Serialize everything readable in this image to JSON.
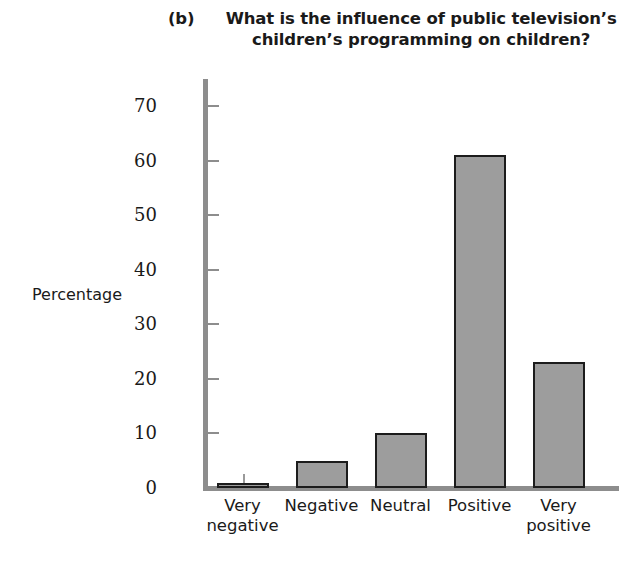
{
  "title": {
    "panel_letter": "(b)",
    "text": "What is the influence of public television’s children’s programming on children?"
  },
  "axes": {
    "ylabel": "Percentage",
    "xlabel": "",
    "y_ticks": [
      "0",
      "10",
      "20",
      "30",
      "40",
      "50",
      "60",
      "70"
    ]
  },
  "categories": [
    {
      "line1": "Very",
      "line2": "negative"
    },
    {
      "line1": "Negative",
      "line2": ""
    },
    {
      "line1": "Neutral",
      "line2": ""
    },
    {
      "line1": "Positive",
      "line2": ""
    },
    {
      "line1": "Very",
      "line2": "positive"
    }
  ],
  "colors": {
    "bar_fill": "#9d9d9d",
    "bar_stroke": "#1c1c1c",
    "axis": "#8d8d8d",
    "text": "#1a1a1a",
    "background": "#ffffff"
  },
  "chart_data": {
    "type": "bar",
    "title": "(b) What is the influence of public television’s children’s programming on children?",
    "xlabel": "",
    "ylabel": "Percentage",
    "categories": [
      "Very negative",
      "Negative",
      "Neutral",
      "Positive",
      "Very positive"
    ],
    "values": [
      1,
      5,
      10,
      61,
      23
    ],
    "ylim": [
      0,
      75
    ],
    "yticks": [
      0,
      10,
      20,
      30,
      40,
      50,
      60,
      70
    ],
    "grid": false,
    "legend": false
  }
}
